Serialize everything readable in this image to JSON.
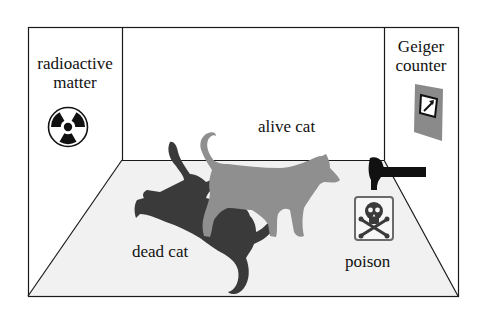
{
  "diagram": {
    "labels": {
      "radioactive_line1": "radioactive",
      "radioactive_line2": "matter",
      "geiger_line1": "Geiger",
      "geiger_line2": "counter",
      "alive_cat": "alive cat",
      "dead_cat": "dead cat",
      "poison": "poison"
    },
    "icons": [
      "radiation-icon",
      "geiger-counter-icon",
      "hammer-icon",
      "skull-crossbones-icon"
    ],
    "colors": {
      "line": "#1a1a1a",
      "floor": "#f1f1f1",
      "dead_cat": "#3a3a3a",
      "alive_cat": "#8f8f8f",
      "geiger_body": "#8a8a8a",
      "poison_box": "#6a6a6a"
    }
  }
}
